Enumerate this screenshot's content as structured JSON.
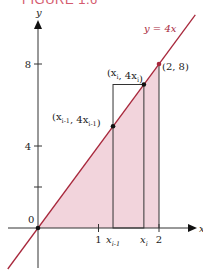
{
  "figure": {
    "title": "FIGURE 1.6",
    "colors": {
      "line": "#a8283c",
      "fill": "#f2d4dc",
      "axis": "#333333",
      "title": "#d45a6e"
    }
  },
  "chart_data": {
    "type": "area",
    "title": "FIGURE 1.6",
    "xlabel": "x",
    "ylabel": "y",
    "xlim": [
      -0.5,
      2.6
    ],
    "ylim": [
      -2,
      10.3
    ],
    "line": {
      "label": "y = 4x",
      "slope": 4
    },
    "shaded_region": {
      "from_x": 0,
      "to_x": 2,
      "under": "y = 4x"
    },
    "x_ticks": [
      {
        "value": 1,
        "label": "1"
      },
      {
        "value": 1.24,
        "label": "x_{i-1}"
      },
      {
        "value": 1.75,
        "label": "x_i"
      },
      {
        "value": 2,
        "label": "2"
      }
    ],
    "y_ticks": [
      {
        "value": 2,
        "label": ""
      },
      {
        "value": 4,
        "label": "4"
      },
      {
        "value": 8,
        "label": "8"
      }
    ],
    "origin_label": "0",
    "rectangle": {
      "x0": 1.24,
      "x1": 1.75,
      "height": 7.0
    },
    "points": [
      {
        "x": 0,
        "y": 0,
        "label": ""
      },
      {
        "x": 1.24,
        "y": 4.96,
        "label": "(x_{i-1}, 4x_{i-1})"
      },
      {
        "x": 1.75,
        "y": 7.0,
        "label": "(x_i, 4x_i)"
      },
      {
        "x": 2,
        "y": 8,
        "label": "(2, 8)"
      }
    ]
  }
}
